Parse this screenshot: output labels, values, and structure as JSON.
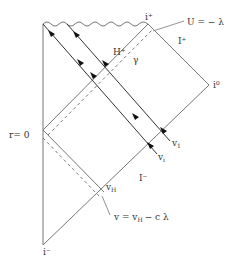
{
  "diagram": {
    "type": "Penrose diagram",
    "labels": {
      "i_plus": "i⁺",
      "i_zero": "i⁰",
      "i_minus": "i⁻",
      "scri_plus": "I⁺",
      "scri_minus": "I⁻",
      "horizon": "H⁺",
      "gamma": "γ",
      "r0": "r= 0",
      "v1_base": "v",
      "v1_sub": "1",
      "vi_base": "v",
      "vi_sub": "i",
      "vH_base": "v",
      "vH_sub": "H",
      "U_eq": "U = − λ",
      "v_eq_pre": "v = v",
      "v_eq_sub": "H",
      "v_eq_post": "− c λ"
    },
    "colors": {
      "line": "#777777",
      "arrow": "#111111",
      "text": "#333333"
    }
  }
}
